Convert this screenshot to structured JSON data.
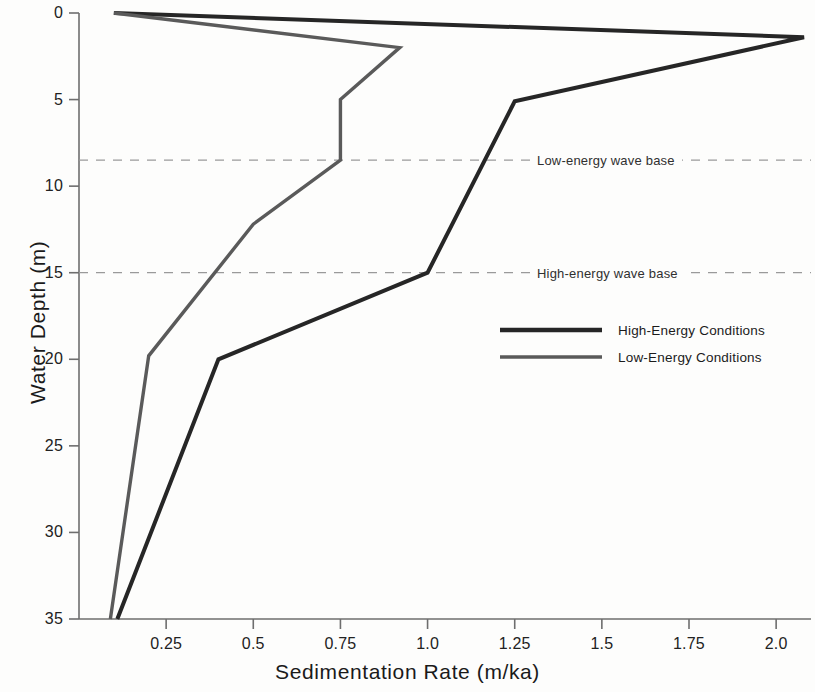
{
  "chart_data": {
    "type": "line",
    "title": "",
    "xlabel": "Sedimentation Rate  (m/ka)",
    "ylabel": "Water Depth (m)",
    "xlim": [
      0.0,
      2.1
    ],
    "ylim": [
      0,
      35
    ],
    "y_inverted": true,
    "grid": false,
    "legend_position": "center-right",
    "xticks": [
      0.25,
      0.5,
      0.75,
      1.0,
      1.25,
      1.5,
      1.75,
      2.0
    ],
    "xtick_labels": [
      "0.25",
      "0.5",
      "0.75",
      "1.0",
      "1.25",
      "1.5",
      "1.75",
      "2.0"
    ],
    "yticks": [
      0,
      5,
      10,
      15,
      20,
      25,
      30,
      35
    ],
    "ytick_labels": [
      "0",
      "5",
      "10",
      "15",
      "20",
      "25",
      "30",
      "35"
    ],
    "series": [
      {
        "name": "High-Energy Conditions",
        "color": "#262626",
        "width": 4.0,
        "points": [
          {
            "rate": 0.1,
            "depth": 0.0
          },
          {
            "rate": 2.08,
            "depth": 1.4
          },
          {
            "rate": 1.25,
            "depth": 5.1
          },
          {
            "rate": 1.0,
            "depth": 15.0
          },
          {
            "rate": 0.4,
            "depth": 20.0
          },
          {
            "rate": 0.11,
            "depth": 35.0
          }
        ]
      },
      {
        "name": "Low-Energy Conditions",
        "color": "#5a5a5a",
        "width": 3.4,
        "points": [
          {
            "rate": 0.1,
            "depth": 0.0
          },
          {
            "rate": 0.92,
            "depth": 2.0
          },
          {
            "rate": 0.75,
            "depth": 5.0
          },
          {
            "rate": 0.75,
            "depth": 8.5
          },
          {
            "rate": 0.5,
            "depth": 12.2
          },
          {
            "rate": 0.2,
            "depth": 19.8
          },
          {
            "rate": 0.09,
            "depth": 35.0
          }
        ]
      }
    ],
    "annotations": [
      {
        "label": "Low-energy wave base",
        "depth": 8.5,
        "style": "dashed-horizontal",
        "color": "#9a9a9a"
      },
      {
        "label": "High-energy wave base",
        "depth": 15.0,
        "style": "dashed-horizontal",
        "color": "#9a9a9a"
      }
    ]
  },
  "legend": {
    "entries": [
      {
        "label": "High-Energy Conditions",
        "color": "#262626"
      },
      {
        "label": "Low-Energy Conditions",
        "color": "#5a5a5a"
      }
    ]
  }
}
